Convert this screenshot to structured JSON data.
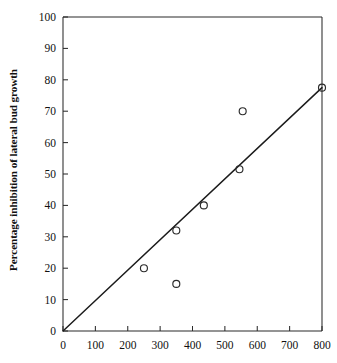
{
  "chart_data": {
    "type": "scatter",
    "title": "",
    "xlabel": "",
    "ylabel": "Percentage inhibition of lateral bud growth",
    "xlim": [
      0,
      800
    ],
    "ylim": [
      0,
      100
    ],
    "xticks": [
      0,
      100,
      200,
      300,
      400,
      500,
      600,
      700,
      800
    ],
    "xtick_labels": [
      "0",
      "100",
      "200",
      "300",
      "400",
      "500",
      "600",
      "700",
      "800"
    ],
    "yticks": [
      0,
      10,
      20,
      30,
      40,
      50,
      60,
      70,
      80,
      90,
      100
    ],
    "ytick_labels": [
      "0",
      "10",
      "20",
      "30",
      "40",
      "50",
      "60",
      "70",
      "80",
      "90",
      "100"
    ],
    "grid": false,
    "legend": null,
    "marker": "open-circle",
    "points": [
      {
        "x": 250,
        "y": 20
      },
      {
        "x": 350,
        "y": 15
      },
      {
        "x": 350,
        "y": 32
      },
      {
        "x": 435,
        "y": 40
      },
      {
        "x": 545,
        "y": 51.5
      },
      {
        "x": 555,
        "y": 70
      },
      {
        "x": 800,
        "y": 77.5
      }
    ],
    "series": [
      {
        "name": "observations",
        "type": "scatter",
        "x": [
          250,
          350,
          350,
          435,
          545,
          555,
          800
        ],
        "values": [
          20,
          15,
          32,
          40,
          51.5,
          70,
          77.5
        ]
      },
      {
        "name": "fitted-line",
        "type": "line",
        "x": [
          0,
          800
        ],
        "values": [
          0,
          77.5
        ]
      }
    ],
    "colors": {
      "axis": "#2b2b2b",
      "marker_stroke": "#2a2a2a",
      "line": "#1b1b1b",
      "background": "#ffffff",
      "text": "#111111"
    }
  }
}
